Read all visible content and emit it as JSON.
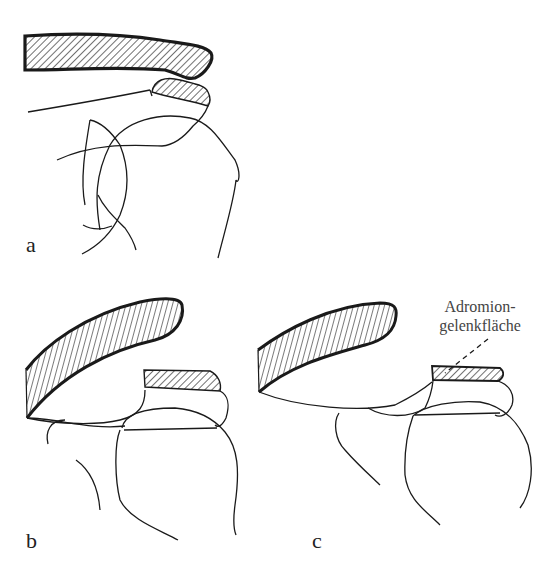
{
  "figure": {
    "panels": [
      {
        "id": "a",
        "label": "a"
      },
      {
        "id": "b",
        "label": "b"
      },
      {
        "id": "c",
        "label": "c"
      }
    ],
    "annotation": {
      "line1": "Adromion-",
      "line2": "gelenkfläche"
    },
    "colors": {
      "ink": "#1a1a1a",
      "hatch": "#333333",
      "background": "#ffffff"
    }
  }
}
